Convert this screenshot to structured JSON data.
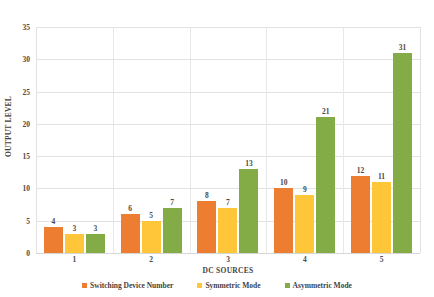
{
  "chart_data": {
    "type": "bar",
    "title": "",
    "subtitle": "",
    "xlabel": "DC SOURCES",
    "ylabel": "OUTPUT LEVEL",
    "categories": [
      "1",
      "2",
      "3",
      "4",
      "5"
    ],
    "series": [
      {
        "name": "Switching Device Number",
        "color": "#ED7D31",
        "values": [
          4,
          6,
          8,
          10,
          12
        ]
      },
      {
        "name": "Symmetric Mode",
        "color": "#FFC639",
        "values": [
          3,
          5,
          7,
          9,
          11
        ]
      },
      {
        "name": "Asymmetric Mode",
        "color": "#84AC46",
        "values": [
          3,
          7,
          13,
          21,
          31
        ]
      }
    ],
    "ylim": [
      0,
      35
    ],
    "yticks": [
      0,
      5,
      10,
      15,
      20,
      25,
      30,
      35
    ],
    "ytick_labels": [
      "0",
      "5",
      "10",
      "15",
      "20",
      "25",
      "30",
      "35"
    ],
    "grid": true,
    "grid_horizontal": true,
    "grid_vertical": true,
    "legend_position": "bottom",
    "data_labels": true,
    "background_color": "#ffffff",
    "grid_color": "#e2e2e2",
    "text_color": "#4a4a4a"
  }
}
